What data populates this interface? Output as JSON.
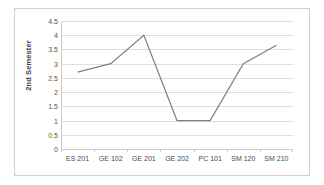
{
  "chart_data": {
    "type": "line",
    "title": "",
    "xlabel": "",
    "ylabel": "2nd Semester",
    "categories": [
      "ES 201",
      "GE 102",
      "GE 201",
      "GE 202",
      "PC 101",
      "SM 120",
      "SM 210"
    ],
    "values": [
      2.7,
      3.0,
      4.0,
      1.0,
      1.0,
      3.0,
      3.65
    ],
    "series": [
      {
        "name": "2nd Semester",
        "values": [
          2.7,
          3.0,
          4.0,
          1.0,
          1.0,
          3.0,
          3.65
        ]
      }
    ],
    "ylim": [
      0,
      4.5
    ],
    "y_ticks": [
      0,
      0.5,
      1,
      1.5,
      2,
      2.5,
      3,
      3.5,
      4,
      4.5
    ],
    "y_tick_labels": [
      "0",
      "0.5",
      "1",
      "1.5",
      "2",
      "2.5",
      "3",
      "3.5",
      "4",
      "4.5"
    ],
    "grid": true,
    "legend": false,
    "legend_position": "none",
    "line_color": "#808080",
    "gridline_color": "#dedede",
    "border_color": "#cfcfcf",
    "markers": false
  }
}
